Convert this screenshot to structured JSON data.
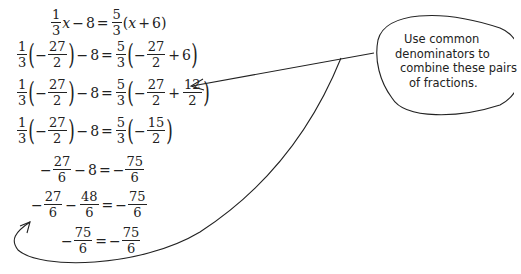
{
  "equations": [
    {
      "lhs": "1/3 x − 8",
      "rhs": "5/3 (x + 6)"
    },
    {
      "lhs": "1/3 (−27/2) − 8",
      "rhs": "5/3 (−27/2 + 6)"
    },
    {
      "lhs": "1/3 (−27/2) − 8",
      "rhs": "5/3 (−27/2 + 12/2)"
    },
    {
      "lhs": "1/3 (−27/2) − 8",
      "rhs": "5/3 (−15/2)"
    },
    {
      "lhs": "−27/6 − 8",
      "rhs": "−75/6"
    },
    {
      "lhs": "−27/6 − 48/6",
      "rhs": "−75/6"
    },
    {
      "lhs": "−75/6",
      "rhs": "−75/6"
    }
  ],
  "t": {
    "one": "1",
    "three": "3",
    "five": "5",
    "two": "2",
    "six": "6",
    "n27": "27",
    "n12": "12",
    "n15": "15",
    "n75": "75",
    "n48": "48",
    "x": "x",
    "minus": "−",
    "eq": "=",
    "plus": "+",
    "eight": "8",
    "lp": "(",
    "rp": ")"
  },
  "bubble": {
    "lines": [
      "Use common",
      "denominators to",
      "combine these pairs",
      "of fractions."
    ]
  },
  "colors": {
    "ink": "#222222",
    "background": "#ffffff"
  }
}
